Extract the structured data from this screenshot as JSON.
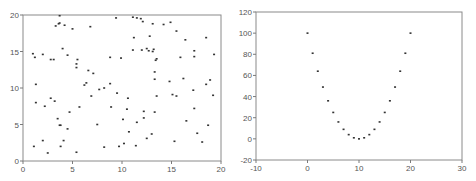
{
  "chart_data": [
    {
      "type": "scatter",
      "title": "",
      "xlabel": "",
      "ylabel": "",
      "xlim": [
        0,
        20
      ],
      "ylim": [
        0,
        20
      ],
      "grid": false,
      "legend": null,
      "x_ticks": [
        "0",
        "5",
        "10",
        "15",
        "20"
      ],
      "y_ticks": [
        "0",
        "5",
        "10",
        "15",
        "20"
      ],
      "points": [
        [
          3.7,
          19.9
        ],
        [
          9.4,
          19.6
        ],
        [
          11.1,
          19.7
        ],
        [
          11.5,
          19.6
        ],
        [
          11.9,
          19.5
        ],
        [
          12.1,
          19.1
        ],
        [
          3.7,
          18.9
        ],
        [
          3.6,
          18.8
        ],
        [
          3.3,
          18.5
        ],
        [
          4.2,
          18.6
        ],
        [
          6.8,
          18.4
        ],
        [
          5.0,
          18.1
        ],
        [
          13.1,
          18.8
        ],
        [
          14.2,
          18.7
        ],
        [
          14.9,
          19.0
        ],
        [
          15.5,
          17.8
        ],
        [
          11.2,
          16.9
        ],
        [
          12.8,
          17.1
        ],
        [
          16.4,
          16.6
        ],
        [
          18.5,
          16.9
        ],
        [
          1.0,
          14.7
        ],
        [
          1.2,
          14.2
        ],
        [
          2.0,
          14.6
        ],
        [
          4.0,
          15.4
        ],
        [
          4.5,
          14.5
        ],
        [
          2.8,
          13.9
        ],
        [
          3.1,
          13.9
        ],
        [
          5.5,
          13.9
        ],
        [
          5.4,
          13.3
        ],
        [
          5.4,
          12.8
        ],
        [
          8.8,
          14.2
        ],
        [
          9.9,
          14.1
        ],
        [
          11.1,
          15.2
        ],
        [
          12.0,
          15.2
        ],
        [
          12.5,
          15.4
        ],
        [
          12.7,
          15.1
        ],
        [
          13.1,
          15.0
        ],
        [
          13.2,
          15.3
        ],
        [
          13.5,
          14.0
        ],
        [
          13.4,
          13.8
        ],
        [
          15.9,
          14.2
        ],
        [
          17.3,
          15.1
        ],
        [
          17.3,
          14.3
        ],
        [
          19.3,
          14.6
        ],
        [
          6.6,
          12.4
        ],
        [
          7.1,
          12.0
        ],
        [
          13.3,
          12.2
        ],
        [
          13.3,
          11.2
        ],
        [
          16.2,
          11.3
        ],
        [
          14.8,
          10.9
        ],
        [
          18.9,
          11.1
        ],
        [
          1.3,
          10.5
        ],
        [
          6.4,
          10.7
        ],
        [
          6.2,
          10.4
        ],
        [
          8.8,
          10.6
        ],
        [
          7.7,
          9.8
        ],
        [
          8.2,
          10.0
        ],
        [
          9.5,
          9.3
        ],
        [
          17.2,
          9.7
        ],
        [
          18.5,
          10.5
        ],
        [
          6.9,
          8.9
        ],
        [
          13.5,
          8.9
        ],
        [
          15.1,
          9.1
        ],
        [
          15.5,
          8.9
        ],
        [
          19.2,
          9.0
        ],
        [
          1.3,
          8.0
        ],
        [
          2.8,
          8.6
        ],
        [
          3.2,
          8.2
        ],
        [
          2.2,
          7.5
        ],
        [
          5.7,
          7.4
        ],
        [
          8.9,
          7.4
        ],
        [
          10.6,
          8.6
        ],
        [
          10.5,
          7.1
        ],
        [
          12.2,
          6.8
        ],
        [
          13.3,
          6.7
        ],
        [
          17.3,
          7.2
        ],
        [
          4.7,
          6.7
        ],
        [
          3.5,
          5.8
        ],
        [
          3.7,
          4.9
        ],
        [
          3.8,
          4.9
        ],
        [
          4.5,
          4.4
        ],
        [
          7.5,
          5.0
        ],
        [
          10.1,
          5.7
        ],
        [
          11.5,
          5.3
        ],
        [
          12.2,
          5.9
        ],
        [
          16.5,
          5.5
        ],
        [
          18.7,
          4.9
        ],
        [
          10.7,
          4.0
        ],
        [
          13.0,
          3.7
        ],
        [
          12.5,
          3.1
        ],
        [
          17.6,
          3.8
        ],
        [
          1.1,
          2.0
        ],
        [
          2.0,
          2.8
        ],
        [
          4.1,
          2.8
        ],
        [
          3.8,
          2.0
        ],
        [
          8.2,
          1.9
        ],
        [
          9.7,
          2.0
        ],
        [
          10.2,
          2.4
        ],
        [
          11.4,
          2.1
        ],
        [
          15.3,
          2.7
        ],
        [
          18.1,
          2.6
        ],
        [
          2.5,
          1.1
        ],
        [
          5.4,
          1.2
        ]
      ]
    },
    {
      "type": "scatter",
      "title": "",
      "xlabel": "",
      "ylabel": "",
      "xlim": [
        -10,
        30
      ],
      "ylim": [
        -20,
        120
      ],
      "grid": false,
      "legend": null,
      "x_ticks": [
        "-10",
        "0",
        "10",
        "20",
        "30"
      ],
      "y_ticks": [
        "-20",
        "0",
        "20",
        "40",
        "60",
        "80",
        "100",
        "120"
      ],
      "x": [
        0,
        1,
        2,
        3,
        4,
        5,
        6,
        7,
        8,
        9,
        10,
        11,
        12,
        13,
        14,
        15,
        16,
        17,
        18,
        19,
        20
      ],
      "y": [
        100,
        81,
        64,
        49,
        36,
        25,
        16,
        9,
        4,
        1,
        0,
        1,
        4,
        9,
        16,
        25,
        36,
        49,
        64,
        81,
        100
      ]
    }
  ]
}
